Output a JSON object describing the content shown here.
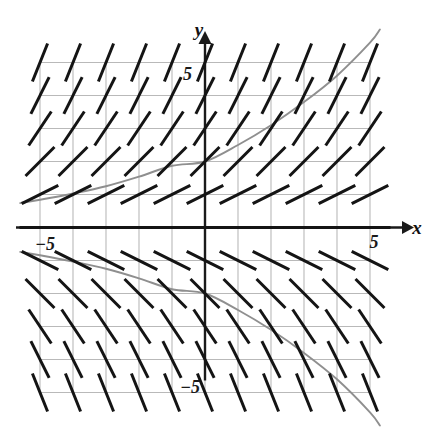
{
  "figure": {
    "axis_labels": {
      "x": "x",
      "y": "y"
    },
    "tick_labels": {
      "x_positive": "5",
      "x_negative": "−5",
      "y_positive": "5",
      "y_negative": "−5"
    },
    "colors": {
      "background": "#ffffff",
      "grid": "#b9b9b9",
      "axis": "#1a1a1a",
      "slope_mark": "#141414",
      "curve": "#8f8f8f"
    }
  },
  "chart_data": {
    "type": "scatter",
    "xlabel": "x",
    "ylabel": "y",
    "xlim": [
      -5,
      5
    ],
    "ylim": [
      -5,
      5
    ],
    "grid": true,
    "legend": "none",
    "xticks": [
      -5,
      5
    ],
    "yticks": [
      -5,
      5
    ],
    "xtick_labels": [
      "−5",
      "5"
    ],
    "ytick_labels": [
      "−5",
      "5"
    ],
    "slope_field": {
      "description": "Short line segments whose slope depends only on y; horizontal along y=0, tilting upward for y>0 and downward for y<0, steeper as |y| grows.",
      "equation": "dy/dx = y/2",
      "x_samples": [
        -5,
        -4,
        -3,
        -2,
        -1,
        0,
        1,
        2,
        3,
        4,
        5
      ],
      "y_samples": [
        5,
        4,
        3,
        2,
        1,
        0,
        -1,
        -2,
        -3,
        -4,
        -5
      ],
      "segment_length_units": 0.62,
      "slopes_by_y": {
        "5": 2.5,
        "4": 2.0,
        "3": 1.5,
        "2": 1.0,
        "1": 0.5,
        "0": 0.0,
        "-1": -0.5,
        "-2": -1.0,
        "-3": -1.5,
        "-4": -2.0,
        "-5": -2.5
      }
    },
    "series": [
      {
        "name": "upper solution curve",
        "equation": "y = 2e^(x/5)",
        "x": [
          -5.6,
          -5,
          -4,
          -3,
          -2,
          -1,
          0,
          1,
          2,
          3,
          4,
          5,
          5.3
        ],
        "y": [
          0.74,
          0.84,
          1.03,
          1.25,
          1.54,
          1.87,
          2.0,
          2.5,
          3.1,
          3.8,
          4.6,
          5.6,
          6.0
        ]
      },
      {
        "name": "lower solution curve",
        "equation": "y = -2e^(x/5)",
        "x": [
          -5.6,
          -5,
          -4,
          -3,
          -2,
          -1,
          0,
          1,
          2,
          3,
          4,
          5,
          5.3
        ],
        "y": [
          -0.74,
          -0.84,
          -1.03,
          -1.25,
          -1.54,
          -1.87,
          -2.0,
          -2.5,
          -3.1,
          -3.8,
          -4.6,
          -5.6,
          -6.0
        ]
      }
    ]
  }
}
